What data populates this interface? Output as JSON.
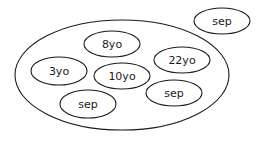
{
  "diagram": {
    "container": {
      "label": "",
      "cx": 122,
      "cy": 75,
      "rx": 107,
      "ry": 55
    },
    "inner_nodes": [
      {
        "label": "8yo",
        "cx": 112,
        "cy": 44,
        "rx": 28,
        "ry": 13
      },
      {
        "label": "22yo",
        "cx": 182,
        "cy": 60,
        "rx": 28,
        "ry": 13
      },
      {
        "label": "3yo",
        "cx": 59,
        "cy": 71,
        "rx": 28,
        "ry": 14
      },
      {
        "label": "10yo",
        "cx": 122,
        "cy": 76,
        "rx": 28,
        "ry": 13
      },
      {
        "label": "sep",
        "cx": 174,
        "cy": 93,
        "rx": 28,
        "ry": 13
      },
      {
        "label": "sep",
        "cx": 88,
        "cy": 104,
        "rx": 28,
        "ry": 14
      }
    ],
    "outer_nodes": [
      {
        "label": "sep",
        "cx": 222,
        "cy": 21,
        "rx": 28,
        "ry": 13
      }
    ],
    "stroke_color": "#1a1a1a",
    "background_color": "#ffffff"
  }
}
